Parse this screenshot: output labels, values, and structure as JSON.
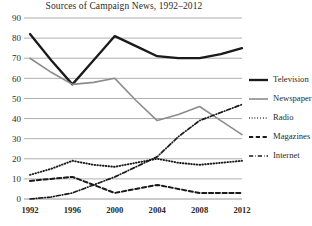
{
  "chart_data": {
    "type": "line",
    "title": "Sources of Campaign News, 1992–2012",
    "xlabel": "",
    "ylabel": "",
    "xlim": [
      1992,
      2012
    ],
    "ylim": [
      0,
      90
    ],
    "ytick_step": 10,
    "grid": true,
    "legend_position": "right",
    "xticks": [
      "1992",
      "1996",
      "2000",
      "2004",
      "2008",
      "2012"
    ],
    "yticks": [
      "0",
      "10",
      "20",
      "30",
      "40",
      "50",
      "60",
      "70",
      "80",
      "90"
    ],
    "x": [
      1992,
      1994,
      1996,
      1998,
      2000,
      2002,
      2004,
      2006,
      2008,
      2010,
      2012
    ],
    "series": [
      {
        "name": "Television",
        "style": "solid-thick",
        "color": "#1a1a1a",
        "values": [
          82,
          69,
          57,
          69,
          81,
          76,
          71,
          70,
          70,
          72,
          75
        ]
      },
      {
        "name": "Newspapers",
        "style": "solid",
        "color": "#8c8c8c",
        "values": [
          70,
          63,
          57,
          58,
          60,
          49,
          39,
          42,
          46,
          39,
          32
        ]
      },
      {
        "name": "Radio",
        "style": "dotted",
        "color": "#1a1a1a",
        "values": [
          12,
          15,
          19,
          17,
          16,
          18,
          20,
          18,
          17,
          18,
          19
        ]
      },
      {
        "name": "Magazines",
        "style": "dashed",
        "color": "#1a1a1a",
        "values": [
          9,
          10,
          11,
          7,
          3,
          5,
          7,
          5,
          3,
          3,
          3
        ]
      },
      {
        "name": "Internet",
        "style": "dashdot",
        "color": "#1a1a1a",
        "values": [
          0,
          1,
          3,
          7,
          11,
          16,
          21,
          31,
          39,
          43,
          47
        ]
      }
    ]
  },
  "legend": {
    "items": [
      {
        "label": "Television"
      },
      {
        "label": "Newspapers"
      },
      {
        "label": "Radio"
      },
      {
        "label": "Magazines"
      },
      {
        "label": "Internet"
      }
    ]
  }
}
